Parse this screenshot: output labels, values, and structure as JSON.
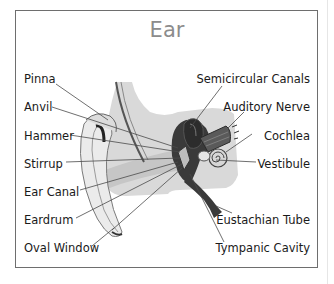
{
  "title": "Ear",
  "labels_left": [
    {
      "text": "Pinna",
      "x": 24,
      "y": 77
    },
    {
      "text": "Anvil",
      "x": 24,
      "y": 100
    },
    {
      "text": "Hammer",
      "x": 24,
      "y": 129
    },
    {
      "text": "Stirrup",
      "x": 24,
      "y": 157
    },
    {
      "text": "Ear Canal",
      "x": 24,
      "y": 185
    },
    {
      "text": "Eardrum",
      "x": 24,
      "y": 213
    },
    {
      "text": "Oval Window",
      "x": 24,
      "y": 241
    }
  ],
  "labels_right": [
    {
      "text": "Semicircular Canals",
      "right": 24,
      "y": 77
    },
    {
      "text": "Auditory Nerve",
      "right": 24,
      "y": 100
    },
    {
      "text": "Cochlea",
      "right": 24,
      "y": 129
    },
    {
      "text": "Vestibule",
      "right": 24,
      "y": 157
    },
    {
      "text": "Eustachian Tube",
      "right": 24,
      "y": 213
    },
    {
      "text": "Tympanic Cavity",
      "right": 24,
      "y": 241
    }
  ],
  "colors": {
    "frame": "#6e6e6e",
    "title": "#8c8c8c",
    "background_shape": "#d9d9d9",
    "ear_light": "#e9e9e9",
    "inner_dark": "#3a3a3a",
    "leader": "#4a4a4a"
  }
}
